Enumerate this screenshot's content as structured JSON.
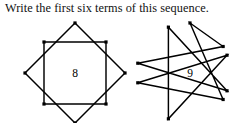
{
  "prompt": {
    "text": "Write the first six terms of this sequence."
  },
  "figures": [
    {
      "name": "star-8",
      "label": "8",
      "points": 8,
      "description": "eight-pointed star formed by two overlapping squares",
      "construction": "two-squares",
      "vertex_dots": true
    },
    {
      "name": "star-9",
      "label": "9",
      "points": 9,
      "description": "nine-pointed star polygon",
      "construction": "nonagram-9-2",
      "vertex_dots": true
    }
  ],
  "colors": {
    "background": "#ffffff",
    "ink": "#000000",
    "text": "#111111"
  }
}
